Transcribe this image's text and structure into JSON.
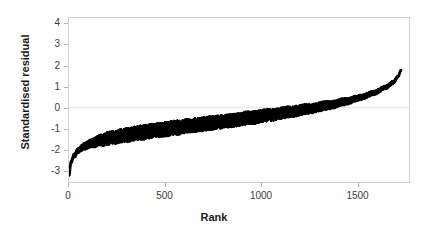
{
  "chart_data": {
    "type": "scatter",
    "title": "",
    "xlabel": "Rank",
    "ylabel": "Standardised residual",
    "xlim": [
      0,
      1772
    ],
    "ylim": [
      -3.55,
      4.3
    ],
    "xticks": [
      0,
      500,
      1000,
      1500
    ],
    "xtick_labels": [
      "0",
      "500",
      "1000",
      "1500"
    ],
    "yticks": [
      4,
      3,
      2,
      1,
      0,
      -1,
      -2,
      -3
    ],
    "ytick_labels": [
      "4",
      "3",
      "2",
      "1",
      "0",
      "-1",
      "-2",
      "-3"
    ],
    "grid": false,
    "legend": null,
    "point_color": "#000000",
    "frame_color": "#d2d2d2",
    "zero_reference_line": 0,
    "n_points": 1730,
    "band_half_width": [
      0.06,
      0.3,
      0.34,
      0.34,
      0.32,
      0.3,
      0.26,
      0.2,
      0.12,
      0.05
    ],
    "curve_x": [
      1,
      10,
      25,
      50,
      80,
      120,
      170,
      230,
      300,
      380,
      470,
      560,
      650,
      750,
      850,
      950,
      1050,
      1150,
      1250,
      1350,
      1440,
      1520,
      1590,
      1650,
      1690,
      1715,
      1730,
      1740,
      1748,
      1755
    ],
    "curve_y": [
      -3.22,
      -2.62,
      -2.3,
      -2.02,
      -1.84,
      -1.68,
      -1.54,
      -1.41,
      -1.3,
      -1.18,
      -1.06,
      -0.95,
      -0.84,
      -0.72,
      -0.6,
      -0.47,
      -0.34,
      -0.2,
      -0.05,
      0.12,
      0.3,
      0.5,
      0.72,
      0.98,
      1.22,
      1.5,
      1.8,
      2.2,
      2.8,
      3.62
    ]
  }
}
